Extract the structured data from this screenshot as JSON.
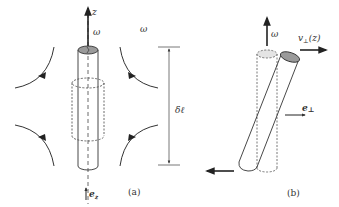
{
  "panel_a": {
    "caption": "(a)",
    "axis_label": "z",
    "vorticity_label": "ω",
    "vorticity_label_outer": "ω",
    "unit_vector_label": "e",
    "unit_vector_sub": "z",
    "segment_length_label": "δℓ",
    "flow_arrows": [
      "top-left",
      "bottom-left",
      "top-right",
      "bottom-right"
    ]
  },
  "panel_b": {
    "caption": "(b)",
    "vorticity_label": "ω",
    "velocity_label": "v",
    "velocity_sub": "⊥",
    "velocity_arg": "(z)",
    "unit_vector_label": "e",
    "unit_vector_sub": "⊥"
  },
  "colors": {
    "line": "#333333",
    "cap_fill": "#9a9a9a",
    "cap_fill_light": "#d9d9d9",
    "dim_line": "#555555"
  }
}
